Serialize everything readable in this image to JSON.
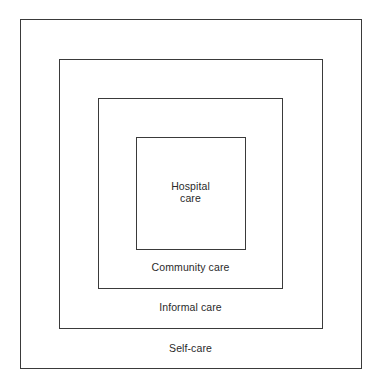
{
  "diagram": {
    "type": "nested-squares",
    "layers": [
      {
        "id": "self",
        "label": "Self-care"
      },
      {
        "id": "informal",
        "label": "Informal care"
      },
      {
        "id": "community",
        "label": "Community care"
      },
      {
        "id": "hospital",
        "label_lines": [
          "Hospital",
          "care"
        ]
      }
    ],
    "colors": {
      "line": "#3a3a3a",
      "text": "#2a2a2a",
      "background": "#ffffff"
    }
  }
}
